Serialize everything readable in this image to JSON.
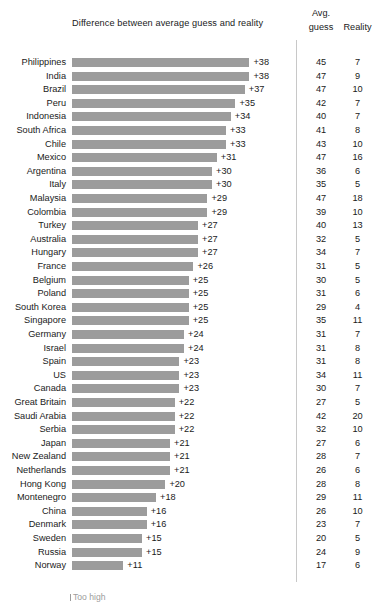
{
  "chart_data": {
    "type": "bar",
    "title": "Difference between average guess and reality",
    "subtitle": "",
    "xlabel": "",
    "ylabel": "",
    "orientation": "horizontal",
    "grid": false,
    "xlim": [
      0,
      40
    ],
    "legend_position": "bottom-left",
    "legend_entries": [
      "Too high"
    ],
    "columns": [
      "Country",
      "Difference",
      "Avg. guess",
      "Reality"
    ],
    "categories": [
      "Philippines",
      "India",
      "Brazil",
      "Peru",
      "Indonesia",
      "South Africa",
      "Chile",
      "Mexico",
      "Argentina",
      "Italy",
      "Malaysia",
      "Colombia",
      "Turkey",
      "Australia",
      "Hungary",
      "France",
      "Belgium",
      "Poland",
      "South Korea",
      "Singapore",
      "Germany",
      "Israel",
      "Spain",
      "US",
      "Canada",
      "Great Britain",
      "Saudi Arabia",
      "Serbia",
      "Japan",
      "New Zealand",
      "Netherlands",
      "Hong Kong",
      "Montenegro",
      "China",
      "Denmark",
      "Sweden",
      "Russia",
      "Norway"
    ],
    "values": [
      38,
      38,
      37,
      35,
      34,
      33,
      33,
      31,
      30,
      30,
      29,
      29,
      27,
      27,
      27,
      26,
      25,
      25,
      25,
      25,
      24,
      24,
      23,
      23,
      23,
      22,
      22,
      22,
      21,
      21,
      21,
      20,
      18,
      16,
      16,
      15,
      15,
      11
    ],
    "value_labels": [
      "+38",
      "+38",
      "+37",
      "+35",
      "+34",
      "+33",
      "+33",
      "+31",
      "+30",
      "+30",
      "+29",
      "+29",
      "+27",
      "+27",
      "+27",
      "+26",
      "+25",
      "+25",
      "+25",
      "+25",
      "+24",
      "+24",
      "+23",
      "+23",
      "+23",
      "+22",
      "+22",
      "+22",
      "+21",
      "+21",
      "+21",
      "+20",
      "+18",
      "+16",
      "+16",
      "+15",
      "+15",
      "+11"
    ],
    "series": [
      {
        "name": "Avg. guess",
        "values": [
          45,
          47,
          47,
          42,
          40,
          41,
          43,
          47,
          36,
          35,
          47,
          39,
          40,
          32,
          34,
          31,
          30,
          31,
          29,
          35,
          31,
          31,
          31,
          34,
          30,
          27,
          42,
          32,
          27,
          28,
          26,
          28,
          29,
          26,
          23,
          20,
          24,
          17
        ]
      },
      {
        "name": "Reality",
        "values": [
          7,
          9,
          10,
          7,
          7,
          8,
          10,
          16,
          6,
          5,
          18,
          10,
          13,
          5,
          7,
          5,
          5,
          6,
          4,
          11,
          7,
          8,
          8,
          11,
          7,
          5,
          20,
          10,
          6,
          7,
          6,
          8,
          11,
          10,
          7,
          5,
          9,
          6
        ]
      }
    ],
    "bar_color": "#9c9c9c",
    "text_color": "#1a1a1a",
    "divider_color": "#c8c8c8"
  },
  "header": {
    "title": "Difference between average guess and reality",
    "avg_line1": "Avg.",
    "avg_line2": "guess",
    "reality": "Reality"
  },
  "legend": {
    "too_high": "Too high"
  }
}
